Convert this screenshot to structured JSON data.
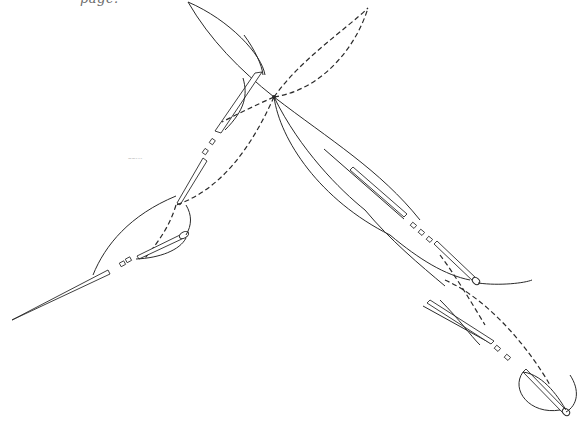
{
  "header": {
    "cropped_caption": "page."
  },
  "figure": {
    "faint_mark": "~~---"
  },
  "colors": {
    "line": "#2a2a2a",
    "background": "#ffffff",
    "caption": "#6a6a6a"
  },
  "elements": {
    "needles": [
      "upper-left-needle",
      "lower-left-needle",
      "middle-right-needle",
      "lower-right-needle-1",
      "lower-right-needle-2"
    ],
    "thread_styles": [
      "solid",
      "dashed"
    ],
    "crossing_point": [
      274,
      97
    ]
  }
}
